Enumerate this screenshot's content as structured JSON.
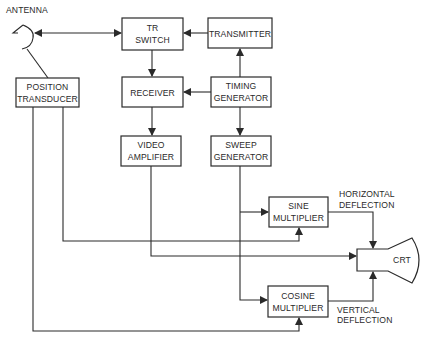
{
  "diagram": {
    "type": "block-diagram",
    "blocks": {
      "tr_switch": {
        "line1": "TR",
        "line2": "SWITCH"
      },
      "transmitter": {
        "line1": "TRANSMITTER"
      },
      "receiver": {
        "line1": "RECEIVER"
      },
      "timing_generator": {
        "line1": "TIMING",
        "line2": "GENERATOR"
      },
      "position_transducer": {
        "line1": "POSITION",
        "line2": "TRANSDUCER"
      },
      "video_amplifier": {
        "line1": "VIDEO",
        "line2": "AMPLIFIER"
      },
      "sweep_generator": {
        "line1": "SWEEP",
        "line2": "GENERATOR"
      },
      "sine_multiplier": {
        "line1": "SINE",
        "line2": "MULTIPLIER"
      },
      "cosine_multiplier": {
        "line1": "COSINE",
        "line2": "MULTIPLIER"
      },
      "crt": {
        "line1": "CRT"
      }
    },
    "labels": {
      "antenna": "ANTENNA",
      "horizontal_deflection": {
        "line1": "HORIZONTAL",
        "line2": "DEFLECTION"
      },
      "vertical_deflection": {
        "line1": "VERTICAL",
        "line2": "DEFLECTION"
      }
    },
    "connections": [
      {
        "from": "antenna",
        "to": "tr_switch",
        "bidirectional": true
      },
      {
        "from": "transmitter",
        "to": "tr_switch"
      },
      {
        "from": "tr_switch",
        "to": "receiver"
      },
      {
        "from": "timing_generator",
        "to": "transmitter"
      },
      {
        "from": "timing_generator",
        "to": "receiver"
      },
      {
        "from": "timing_generator",
        "to": "sweep_generator"
      },
      {
        "from": "receiver",
        "to": "video_amplifier"
      },
      {
        "from": "antenna",
        "to": "position_transducer"
      },
      {
        "from": "sweep_generator",
        "to": "sine_multiplier"
      },
      {
        "from": "sweep_generator",
        "to": "cosine_multiplier"
      },
      {
        "from": "position_transducer",
        "to": "sine_multiplier"
      },
      {
        "from": "position_transducer",
        "to": "cosine_multiplier"
      },
      {
        "from": "video_amplifier",
        "to": "crt"
      },
      {
        "from": "sine_multiplier",
        "to": "crt",
        "label": "HORIZONTAL DEFLECTION"
      },
      {
        "from": "cosine_multiplier",
        "to": "crt",
        "label": "VERTICAL DEFLECTION"
      }
    ]
  }
}
